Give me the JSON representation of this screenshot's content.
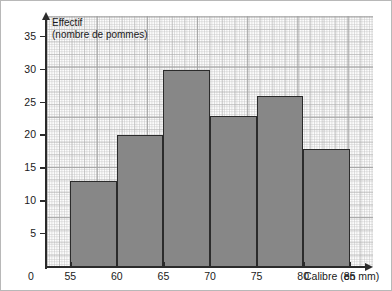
{
  "chart_data": {
    "type": "bar",
    "title": "",
    "ylabel_line1": "Effectif",
    "ylabel_line2": "(nombre de pommes)",
    "xlabel": "Calibre (en mm)",
    "origin_label": "0",
    "categories": [
      "55-60",
      "60-65",
      "65-70",
      "70-75",
      "75-80",
      "80-85"
    ],
    "bin_edges": [
      55,
      60,
      65,
      70,
      75,
      80,
      85
    ],
    "values": [
      13,
      20,
      30,
      23,
      26,
      18
    ],
    "xlim": [
      52.5,
      87.5
    ],
    "ylim": [
      0,
      38
    ],
    "x_ticks": [
      55,
      60,
      65,
      70,
      75,
      80,
      85
    ],
    "x_tick_labels": [
      "55",
      "60",
      "65",
      "70",
      "75",
      "80",
      "85"
    ],
    "y_ticks": [
      5,
      10,
      15,
      20,
      25,
      30,
      35
    ],
    "y_tick_labels": [
      "5",
      "10",
      "15",
      "20",
      "25",
      "30",
      "35"
    ],
    "grid": "graph-paper",
    "legend": "none",
    "bar_fill_color": "#878787",
    "bar_edge_color": "#2b2b2b",
    "axis_color": "#2b2b2b"
  }
}
